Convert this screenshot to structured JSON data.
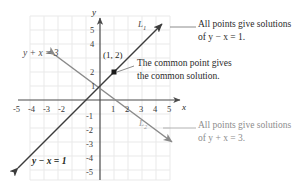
{
  "figure": {
    "type": "coordinate-graph",
    "axes": {
      "x_label": "x",
      "y_label": "y",
      "x_ticks": [
        "-5",
        "-4",
        "-3",
        "-2",
        "1",
        "2",
        "3",
        "4",
        "5"
      ],
      "y_ticks_positive": [
        "5",
        "4",
        "2",
        "1"
      ],
      "y_ticks_negative": [
        "-1",
        "-2",
        "-3",
        "-4",
        "-5"
      ],
      "x_range": [
        -6,
        6
      ],
      "y_range": [
        -6,
        6
      ],
      "grid": true
    },
    "lines": [
      {
        "id": "L1",
        "label": "L_1",
        "equation_label": "y − x = 1",
        "slope": 1,
        "intercept": 1,
        "color": "#3c3c3c",
        "style": "dark"
      },
      {
        "id": "L2",
        "label": "L_2",
        "equation_label": "y + x = 3",
        "slope": -1,
        "intercept": 3,
        "color": "#8a8a8a",
        "style": "light"
      }
    ],
    "intersection": {
      "label": "(1, 2)",
      "x": 1,
      "y": 2
    }
  },
  "labels": {
    "line1_name": "L",
    "line1_sub": "1",
    "line2_name": "L",
    "line2_sub": "2",
    "eq_top_left": "y + x = 3",
    "eq_bottom_left": "y − x = 1",
    "point_label": "(1, 2)"
  },
  "annotations": {
    "top_right": {
      "line1": "All points give solutions",
      "line2": "of y − x = 1."
    },
    "center": {
      "line1": "The common point gives",
      "line2": "the common solution."
    },
    "bottom_right": {
      "line1": "All points give solutions",
      "line2": "of y + x = 3."
    }
  },
  "colors": {
    "grid": "#e8e8e8",
    "axis": "#4a4a4a",
    "line_dark": "#3c3c3c",
    "line_light": "#8a8a8a",
    "text": "#231f20",
    "text_light": "#8d8d8d"
  },
  "ticks": {
    "xm5": "-5",
    "xm4": "-4",
    "xm3": "-3",
    "xm2": "-2",
    "x1": "1",
    "x2": "2",
    "x3": "3",
    "x4": "4",
    "x5": "5",
    "y5": "5",
    "y4": "4",
    "y2": "2",
    "y1": "1",
    "ym1": "-1",
    "ym2": "-2",
    "ym3": "-3",
    "ym4": "-4",
    "ym5": "-5"
  }
}
